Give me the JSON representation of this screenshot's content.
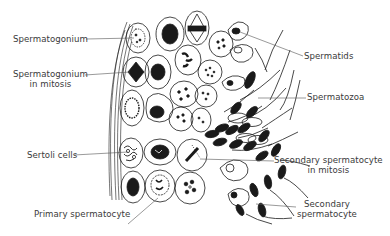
{
  "diagram": {
    "colors": {
      "ink": "#1a1a1a",
      "label": "#3a3a3a",
      "background": "#ffffff"
    },
    "labels": {
      "spermatogonium": "Spermatogonium",
      "spermatogonium_mitosis_1": "Spermatogonium",
      "spermatogonium_mitosis_2": "in mitosis",
      "sertoli": "Sertoli cells",
      "primary": "Primary spermatocyte",
      "spermatids": "Spermatids",
      "spermatozoa": "Spermatozoa",
      "secondary_mitosis_1": "Secondary spermatocyte",
      "secondary_mitosis_2": "in mitosis",
      "secondary_1": "Secondary",
      "secondary_2": "spermatocyte"
    }
  }
}
